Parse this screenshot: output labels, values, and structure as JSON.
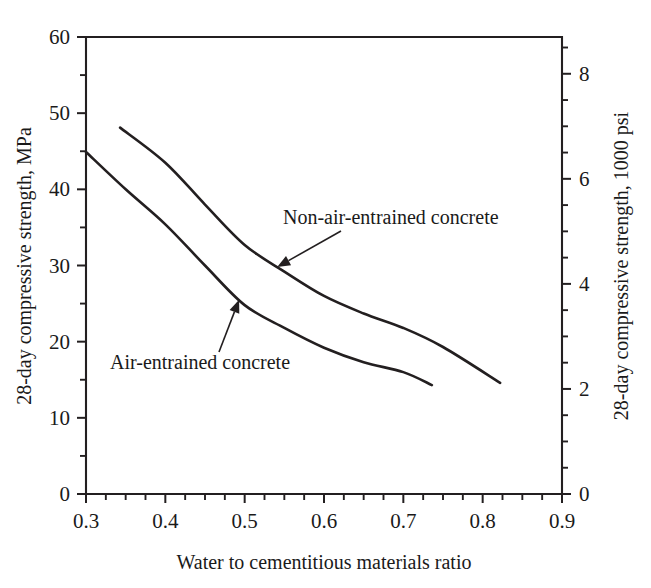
{
  "chart_data": {
    "type": "line",
    "title": "",
    "xlabel": "Water to cementitious materials ratio",
    "ylabel": "28-day compressive strength, MPa",
    "y2label": "28-day compressive strength, 1000 psi",
    "xlim": [
      0.3,
      0.9
    ],
    "ylim": [
      0,
      60
    ],
    "y2lim": [
      0,
      8.7
    ],
    "xticks": [
      "0.3",
      "0.4",
      "0.5",
      "0.6",
      "0.7",
      "0.8",
      "0.9"
    ],
    "xtick_values": [
      0.3,
      0.4,
      0.5,
      0.6,
      0.7,
      0.8,
      0.9
    ],
    "yticks": [
      "0",
      "10",
      "20",
      "30",
      "40",
      "50",
      "60"
    ],
    "ytick_values": [
      0,
      10,
      20,
      30,
      40,
      50,
      60
    ],
    "y2ticks": [
      "0",
      "2",
      "4",
      "6",
      "8"
    ],
    "y2tick_values": [
      0,
      2,
      4,
      6,
      8
    ],
    "xminor_step": 0.025,
    "yminor_step": 5,
    "y2minor_step": 0.5,
    "grid": false,
    "legend_position": "inline-annotations",
    "series": [
      {
        "name": "Non-air-entrained concrete",
        "x": [
          0.343,
          0.4,
          0.45,
          0.5,
          0.55,
          0.6,
          0.65,
          0.7,
          0.75,
          0.822
        ],
        "values": [
          48.1,
          43.5,
          38.0,
          32.7,
          29.2,
          26.0,
          23.7,
          21.8,
          19.3,
          14.6
        ]
      },
      {
        "name": "Air-entrained concrete",
        "x": [
          0.3,
          0.35,
          0.4,
          0.45,
          0.5,
          0.55,
          0.6,
          0.65,
          0.7,
          0.736
        ],
        "values": [
          44.9,
          40.0,
          35.4,
          30.0,
          24.8,
          21.8,
          19.2,
          17.3,
          16.0,
          14.3
        ]
      }
    ],
    "annotations": [
      {
        "name": "non-air-entrained-label",
        "text": "Non-air-entrained concrete",
        "points_to_x": 0.541,
        "points_to_y": 29.8
      },
      {
        "name": "air-entrained-label",
        "text": "Air-entrained concrete",
        "points_to_x": 0.493,
        "points_to_y": 25.5
      }
    ]
  },
  "colors": {
    "line": "#231f20",
    "axis": "#231f20",
    "text": "#1a1a1a",
    "background": "#ffffff"
  }
}
